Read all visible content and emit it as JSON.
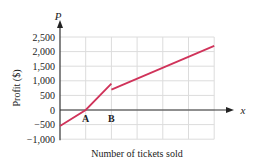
{
  "chart_data": {
    "type": "line",
    "title": "",
    "xlabel": "Number of tickets sold",
    "ylabel": "Profit ($)",
    "x_axis_symbol": "x",
    "y_axis_symbol": "P",
    "yticks": [
      -1000,
      -500,
      0,
      500,
      1000,
      1500,
      2000,
      2500
    ],
    "ytick_labels": [
      "−1,000",
      "−500",
      "0",
      "500",
      "1,000",
      "1,500",
      "2,000",
      "2,500"
    ],
    "ylim": [
      -1000,
      2500
    ],
    "grid": true,
    "x_grid_count": 6,
    "point_labels": [
      {
        "label": "A",
        "x_grid": 1,
        "description": "break-even point, profit = 0"
      },
      {
        "label": "B",
        "x_grid": 2,
        "description": "point of discontinuity (profit drops)"
      }
    ],
    "series": [
      {
        "name": "Profit segment 1",
        "color": "#d0335a",
        "points": [
          [
            0,
            -550
          ],
          [
            1,
            0
          ],
          [
            2,
            900
          ]
        ]
      },
      {
        "name": "Profit segment 2",
        "color": "#d0335a",
        "points": [
          [
            2,
            700
          ],
          [
            6,
            2200
          ]
        ]
      }
    ]
  }
}
